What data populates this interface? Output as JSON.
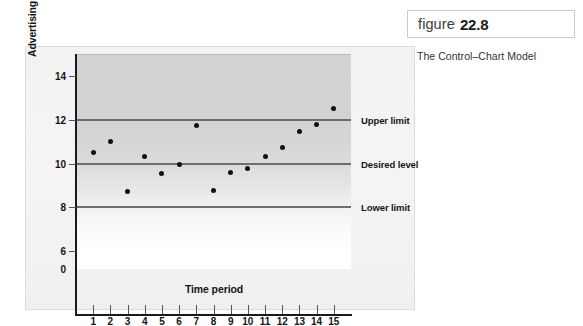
{
  "figure": {
    "word": "figure",
    "number": "22.8",
    "caption": "The Control–Chart Model"
  },
  "chart_data": {
    "type": "scatter",
    "title": "",
    "xlabel": "Time period",
    "ylabel": "Advertising expense/Sales ratio",
    "x": [
      1,
      2,
      3,
      4,
      5,
      6,
      7,
      8,
      9,
      10,
      11,
      12,
      13,
      14,
      15
    ],
    "values": [
      10.5,
      11.0,
      8.7,
      10.3,
      9.55,
      9.95,
      11.75,
      8.75,
      9.6,
      9.75,
      10.3,
      10.75,
      11.45,
      11.8,
      12.5
    ],
    "xtick_labels": [
      "1",
      "2",
      "3",
      "4",
      "5",
      "6",
      "7",
      "8",
      "9",
      "10",
      "11",
      "12",
      "13",
      "14",
      "15"
    ],
    "ytick_labels": [
      "0",
      "6",
      "8",
      "10",
      "12",
      "14"
    ],
    "ytick_values": [
      0,
      6,
      8,
      10,
      12,
      14
    ],
    "ylim": [
      0,
      15
    ],
    "axis_break": true,
    "grid": false,
    "legend": "none",
    "reference_lines": [
      {
        "label": "Upper limit",
        "value": 12
      },
      {
        "label": "Desired level",
        "value": 10
      },
      {
        "label": "Lower limit",
        "value": 8
      }
    ],
    "colors": {
      "point": "#111111",
      "reference_line": "#6e6e6e",
      "axis": "#1a1a1a",
      "panel": "#f2f2f2"
    }
  }
}
